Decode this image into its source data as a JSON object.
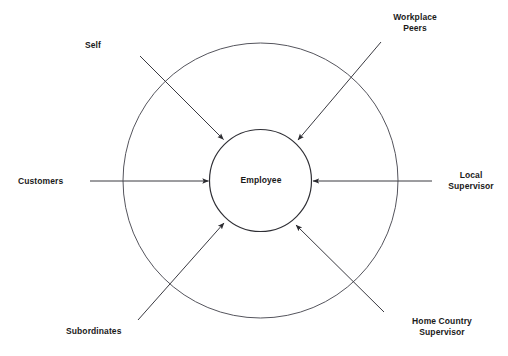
{
  "diagram": {
    "type": "radial-feedback-model",
    "center_node": {
      "label": "Employee",
      "shape": "circle"
    },
    "outer_ring": {
      "shape": "circle",
      "label": ""
    },
    "sources": [
      {
        "id": "self",
        "label": "Self",
        "position": "top-left",
        "arrow": "inward"
      },
      {
        "id": "workplace-peers",
        "label": "Workplace\nPeers",
        "position": "top-right",
        "arrow": "inward"
      },
      {
        "id": "customers",
        "label": "Customers",
        "position": "left",
        "arrow": "inward"
      },
      {
        "id": "local-supervisor",
        "label": "Local\nSupervisor",
        "position": "right",
        "arrow": "inward"
      },
      {
        "id": "subordinates",
        "label": "Subordinates",
        "position": "bottom-left",
        "arrow": "inward"
      },
      {
        "id": "home-country-supervisor",
        "label": "Home Country\nSupervisor",
        "position": "bottom-right",
        "arrow": "inward"
      }
    ],
    "colors": {
      "stroke": "#4a4a52",
      "text": "#1a1a1a",
      "background": "#ffffff"
    }
  }
}
